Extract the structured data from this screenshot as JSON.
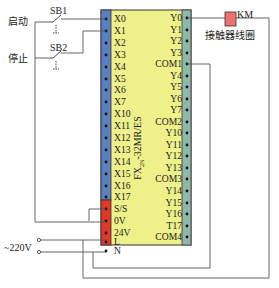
{
  "diagram": {
    "plc_model": "FX2N-32MR/ES",
    "plc_model_main": "FX",
    "plc_model_sub": "2N",
    "plc_model_rest": "-32MR/ES",
    "switches": [
      {
        "id": "SB1",
        "label": "启动"
      },
      {
        "id": "SB2",
        "label": "停止"
      }
    ],
    "coil": {
      "id": "KM",
      "label": "接触器线圈"
    },
    "power": "~220V",
    "input_terminals": [
      "X0",
      "X1",
      "X2",
      "X3",
      "X4",
      "X5",
      "X6",
      "X7",
      "X10",
      "X11",
      "X12",
      "X13",
      "X14",
      "X15",
      "X16",
      "X17"
    ],
    "power_terminals": [
      "S/S",
      "0V",
      "24V",
      "L",
      "N"
    ],
    "output_terminals": [
      "Y0",
      "Y1",
      "Y2",
      "Y3",
      "COM1",
      "Y4",
      "Y5",
      "Y6",
      "Y7",
      "COM2",
      "Y10",
      "Y11",
      "Y12",
      "Y13",
      "COM3",
      "Y14",
      "Y15",
      "Y16",
      "T17",
      "COM4"
    ],
    "colors": {
      "body": "#eef08a",
      "input_strip": "#5b7fc0",
      "power_strip": "#e0372a",
      "output_strip": "#8fb8a8",
      "coil": "#f07070",
      "wire": "#555555"
    }
  }
}
